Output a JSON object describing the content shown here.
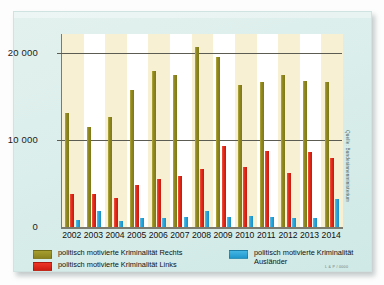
{
  "chart_data": {
    "type": "bar",
    "title": "",
    "xlabel": "",
    "ylabel": "",
    "ylim": [
      0,
      22000
    ],
    "yticks": [
      0,
      10000,
      20000
    ],
    "ytick_labels": [
      "0",
      "10 000",
      "20 000"
    ],
    "grid": true,
    "legend_position": "bottom",
    "categories": [
      "2002",
      "2003",
      "2004",
      "2005",
      "2006",
      "2007",
      "2008",
      "2009",
      "2010",
      "2011",
      "2012",
      "2013",
      "2014"
    ],
    "series": [
      {
        "name": "politisch motivierte Kriminalität Rechts",
        "color": "#8f8820",
        "values": [
          13200,
          11600,
          12800,
          15900,
          18100,
          17600,
          20800,
          19700,
          16400,
          16800,
          17600,
          16900,
          16800
        ]
      },
      {
        "name": "politisch motivierte Kriminalität Links",
        "color": "#e12819",
        "values": [
          3900,
          3900,
          3500,
          5000,
          5600,
          6000,
          6800,
          9400,
          7000,
          8800,
          6300,
          8700,
          8100
        ]
      },
      {
        "name": "politisch motivierte Kriminalität Ausländer",
        "color": "#2aa5da",
        "values": [
          900,
          2000,
          800,
          1100,
          1100,
          1300,
          2000,
          1300,
          1400,
          1300,
          1100,
          1200,
          3300
        ]
      }
    ]
  },
  "legend": {
    "rechts": "politisch motivierte Kriminalität Rechts",
    "links": "politisch motivierte Kriminalität Links",
    "auslaender_line1": "politisch motivierte Kriminalität",
    "auslaender_line2": "Ausländer"
  },
  "source": "Quelle: Bundesinnenministerium",
  "imprint": "L & P / 0000",
  "colors": {
    "rechts": "#8f8820",
    "links": "#e12819",
    "auslaender": "#2aa5da",
    "card": "#daeeeb",
    "band": "#f7f0d2",
    "axis": "#5c5c52"
  }
}
